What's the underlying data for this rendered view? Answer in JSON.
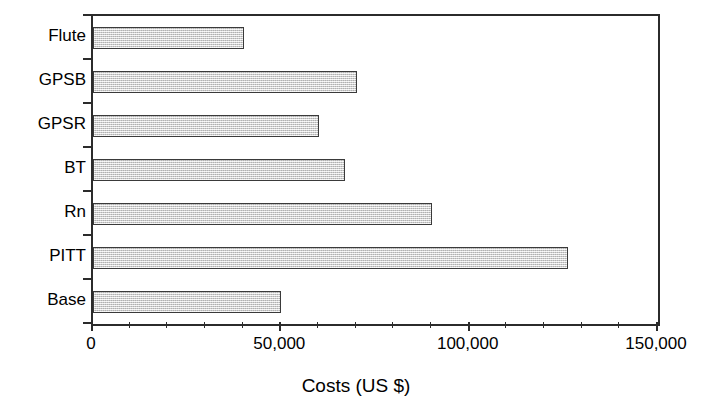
{
  "chart_data": {
    "type": "bar",
    "orientation": "horizontal",
    "title": "",
    "subtitle": "",
    "xlabel": "Costs (US $)",
    "ylabel": "",
    "categories": [
      "Flute",
      "GPSB",
      "GPSR",
      "BT",
      "Rn",
      "PITT",
      "Base"
    ],
    "values": [
      40000,
      70000,
      60000,
      67000,
      90000,
      126000,
      50000
    ],
    "series": [
      {
        "name": "Costs",
        "values": [
          40000,
          70000,
          60000,
          67000,
          90000,
          126000,
          50000
        ]
      }
    ],
    "xlim": [
      0,
      150000
    ],
    "xticks": [
      0,
      50000,
      100000,
      150000
    ],
    "xtick_labels": [
      "0",
      "50,000",
      "100,000",
      "150,000"
    ],
    "xminor_tick_interval": 10000,
    "grid": false,
    "legend": false,
    "legend_position": "none",
    "bar_fill_color": "#d0d0d0",
    "bar_edge_color": "#3a3a3a",
    "axis_color": "#2b2b2b",
    "background_color": "#ffffff"
  },
  "axis": {
    "x_title": "Costs (US $)",
    "tick_labels": [
      "0",
      "50,000",
      "100,000",
      "150,000"
    ],
    "category_labels": [
      "Flute",
      "GPSB",
      "GPSR",
      "BT",
      "Rn",
      "PITT",
      "Base"
    ]
  }
}
